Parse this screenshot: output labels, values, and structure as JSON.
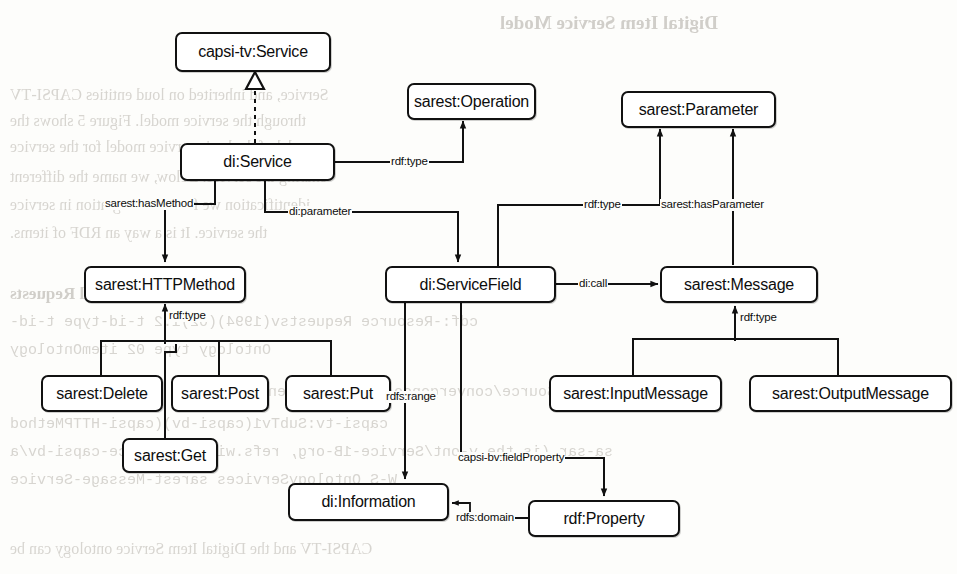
{
  "diagram": {
    "stroke_color": "#111111",
    "fill_color": "#ffffff",
    "background_color": "#fdfdfb",
    "nodes": [
      {
        "id": "capsi_tv_service",
        "label": "capsi-tv:Service"
      },
      {
        "id": "di_service",
        "label": "di:Service"
      },
      {
        "id": "sarest_operation",
        "label": "sarest:Operation"
      },
      {
        "id": "sarest_parameter",
        "label": "sarest:Parameter"
      },
      {
        "id": "sarest_httpmethod",
        "label": "sarest:HTTPMethod"
      },
      {
        "id": "di_servicefield",
        "label": "di:ServiceField"
      },
      {
        "id": "sarest_message",
        "label": "sarest:Message"
      },
      {
        "id": "sarest_delete",
        "label": "sarest:Delete"
      },
      {
        "id": "sarest_post",
        "label": "sarest:Post"
      },
      {
        "id": "sarest_put",
        "label": "sarest:Put"
      },
      {
        "id": "sarest_get",
        "label": "sarest:Get"
      },
      {
        "id": "sarest_inputmessage",
        "label": "sarest:InputMessage"
      },
      {
        "id": "sarest_outputmessage",
        "label": "sarest:OutputMessage"
      },
      {
        "id": "di_information",
        "label": "di:Information"
      },
      {
        "id": "rdf_property",
        "label": "rdf:Property"
      }
    ],
    "edges": [
      {
        "id": "e_subclass",
        "from": "di_service",
        "to": "capsi_tv_service",
        "label": "",
        "style": "dashed-hollow-triangle"
      },
      {
        "id": "e_rdftype_op",
        "from": "di_service",
        "to": "sarest_operation",
        "label": "rdf:type",
        "style": "solid-arrow"
      },
      {
        "id": "e_hasmethod",
        "from": "di_service",
        "to": "sarest_httpmethod",
        "label": "sarest:hasMethod",
        "style": "solid-arrow"
      },
      {
        "id": "e_parameter",
        "from": "di_service",
        "to": "di_servicefield",
        "label": "di:parameter",
        "style": "solid-arrow"
      },
      {
        "id": "e_rdftype_param",
        "from": "di_servicefield",
        "to": "sarest_parameter",
        "label": "rdf:type",
        "style": "solid-arrow"
      },
      {
        "id": "e_hasparameter",
        "from": "sarest_message",
        "to": "sarest_parameter",
        "label": "sarest:hasParameter",
        "style": "solid-arrow"
      },
      {
        "id": "e_dicall",
        "from": "di_servicefield",
        "to": "sarest_message",
        "label": "di:call",
        "style": "solid-arrow"
      },
      {
        "id": "e_rdftype_http",
        "from": "sarest_delete",
        "to": "sarest_httpmethod",
        "label": "rdf:type",
        "style": "solid-arrow-fanin"
      },
      {
        "id": "e_rdftype_msg",
        "from": "sarest_inputmessage",
        "to": "sarest_message",
        "label": "rdf:type",
        "style": "solid-arrow-fanin"
      },
      {
        "id": "e_rdfsrange",
        "from": "di_servicefield",
        "to": "di_information",
        "label": "rdfs:range",
        "style": "solid-arrow"
      },
      {
        "id": "e_fieldproperty",
        "from": "di_servicefield",
        "to": "rdf_property",
        "label": "capsi-bv:fieldProperty",
        "style": "solid-arrow"
      },
      {
        "id": "e_rdfsdomain",
        "from": "rdf_property",
        "to": "di_information",
        "label": "rdfs:domain",
        "style": "solid-arrow"
      }
    ]
  },
  "bleed_text": {
    "heading": "Digital Item Service Model",
    "lines": [
      "Service, and inherited on loud entities CAPSI-TV",
      "through the service model. Figure 5 shows the",
      "model of the basic service model for the service",
      "sharing the service. Below, we name the different",
      "identification we find the integration in service",
      "the service. It is a way an RDF of items.",
      "Current Service Model Requests",
      "cdf:-Resource Requestsv(1994)(02)1.2   t-id-type   t-id-",
      "Ontology   type 02   itemOntology",
      "MessageSource/convergence(25)/convergence",
      "capsi-tv:SubTv1(capsi-bv)(capsi-HTTPMethod",
      "sa-sar   (is the   v-ont/Service-1B-org, refs.wiki-v/Service-capsi-bv/a",
      "W-S   OntologyServices   sarest-Message-Service",
      "CAPSI-TV and the Digital Item Service ontology can be"
    ]
  }
}
